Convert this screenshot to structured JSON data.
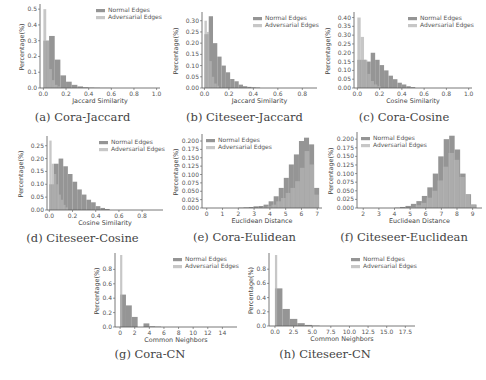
{
  "colors": {
    "normal": "#8f8f8f",
    "adversarial": "#b4b4b4",
    "axis": "#555555"
  },
  "legend": {
    "normal": "Normal Edges",
    "adversarial": "Adversarial Edges"
  },
  "chart_data": [
    {
      "id": "a",
      "type": "bar",
      "title": "",
      "caption": "(a) Cora-Jaccard",
      "xlabel": "Jaccard Similarity",
      "ylabel": "Percentage(%)",
      "xlim": [
        -0.03,
        1.03
      ],
      "ylim": [
        0,
        0.52
      ],
      "xticks": [
        0.0,
        0.2,
        0.4,
        0.6,
        0.8,
        1.0
      ],
      "xtick_labels": [
        "0.0",
        "0.2",
        "0.4",
        "0.6",
        "0.8",
        "1.0"
      ],
      "yticks": [
        0.0,
        0.1,
        0.2,
        0.3,
        0.4,
        0.5
      ],
      "ytick_labels": [
        "0.0",
        "0.1",
        "0.2",
        "0.3",
        "0.4",
        "0.5"
      ],
      "legend_position": "upper right",
      "series": [
        {
          "name": "Normal Edges",
          "bin_start": 0.0,
          "bin_width": 0.05,
          "values": [
            0.3,
            0.33,
            0.18,
            0.08,
            0.04,
            0.02,
            0.01,
            0.005,
            0.003,
            0.002,
            0.001,
            0.001
          ]
        },
        {
          "name": "Adversarial Edges",
          "bin_start": 0.0,
          "bin_width": 0.025,
          "values": [
            0.5,
            0.3,
            0.12,
            0.05,
            0.02,
            0.01
          ]
        }
      ]
    },
    {
      "id": "b",
      "type": "bar",
      "title": "",
      "caption": "(b) Citeseer-Jaccard",
      "xlabel": "Jaccard Similarity",
      "ylabel": "Percentage(%)",
      "xlim": [
        -0.02,
        0.92
      ],
      "ylim": [
        0,
        0.33
      ],
      "xticks": [
        0.0,
        0.2,
        0.4,
        0.6,
        0.8
      ],
      "xtick_labels": [
        "0.0",
        "0.2",
        "0.4",
        "0.6",
        "0.8"
      ],
      "yticks": [
        0.0,
        0.05,
        0.1,
        0.15,
        0.2,
        0.25,
        0.3
      ],
      "ytick_labels": [
        "0.00",
        "0.05",
        "0.10",
        "0.15",
        "0.20",
        "0.25",
        "0.30"
      ],
      "legend_position": "upper right",
      "series": [
        {
          "name": "Normal Edges",
          "bin_start": 0.0,
          "bin_width": 0.035,
          "values": [
            0.24,
            0.32,
            0.2,
            0.14,
            0.1,
            0.07,
            0.04,
            0.03,
            0.015,
            0.008,
            0.005,
            0.003,
            0.002
          ]
        },
        {
          "name": "Adversarial Edges",
          "bin_start": 0.0,
          "bin_width": 0.02,
          "values": [
            0.3,
            0.25,
            0.12,
            0.05,
            0.02,
            0.01
          ]
        }
      ]
    },
    {
      "id": "c",
      "type": "bar",
      "title": "",
      "caption": "(c) Cora-Cosine",
      "xlabel": "Cosine Similarity",
      "ylabel": "Percentage(%)",
      "xlim": [
        -0.03,
        1.03
      ],
      "ylim": [
        0,
        0.42
      ],
      "xticks": [
        0.0,
        0.2,
        0.4,
        0.6,
        0.8,
        1.0
      ],
      "xtick_labels": [
        "0.0",
        "0.2",
        "0.4",
        "0.6",
        "0.8",
        "1.0"
      ],
      "yticks": [
        0.0,
        0.05,
        0.1,
        0.15,
        0.2,
        0.25,
        0.3,
        0.35,
        0.4
      ],
      "ytick_labels": [
        "0.00",
        "0.05",
        "0.10",
        "0.15",
        "0.20",
        "0.25",
        "0.30",
        "0.35",
        "0.40"
      ],
      "legend_position": "upper right",
      "series": [
        {
          "name": "Normal Edges",
          "bin_start": 0.0,
          "bin_width": 0.04,
          "values": [
            0.16,
            0.16,
            0.15,
            0.2,
            0.16,
            0.13,
            0.1,
            0.07,
            0.05,
            0.03,
            0.02,
            0.01,
            0.005
          ]
        },
        {
          "name": "Adversarial Edges",
          "bin_start": 0.0,
          "bin_width": 0.03,
          "values": [
            0.4,
            0.29,
            0.16,
            0.08,
            0.04,
            0.02,
            0.01
          ]
        }
      ]
    },
    {
      "id": "d",
      "type": "bar",
      "title": "",
      "caption": "(d) Citeseer-Cosine",
      "xlabel": "Cosine Similarity",
      "ylabel": "Percentage(%)",
      "xlim": [
        -0.02,
        0.98
      ],
      "ylim": [
        0,
        0.28
      ],
      "xticks": [
        0.0,
        0.2,
        0.4,
        0.6,
        0.8
      ],
      "xtick_labels": [
        "0.0",
        "0.2",
        "0.4",
        "0.6",
        "0.8"
      ],
      "yticks": [
        0.0,
        0.05,
        0.1,
        0.15,
        0.2,
        0.25
      ],
      "ytick_labels": [
        "0.00",
        "0.05",
        "0.10",
        "0.15",
        "0.20",
        "0.25"
      ],
      "legend_position": "upper right",
      "series": [
        {
          "name": "Normal Edges",
          "bin_start": 0.0,
          "bin_width": 0.04,
          "values": [
            0.1,
            0.18,
            0.2,
            0.17,
            0.14,
            0.11,
            0.08,
            0.06,
            0.04,
            0.03,
            0.015,
            0.008,
            0.004
          ]
        },
        {
          "name": "Adversarial Edges",
          "bin_start": 0.0,
          "bin_width": 0.02,
          "values": [
            0.27,
            0.18,
            0.14,
            0.1,
            0.06,
            0.04,
            0.02,
            0.01
          ]
        }
      ]
    },
    {
      "id": "e",
      "type": "bar",
      "title": "",
      "caption": "(e) Cora-Eulidean",
      "xlabel": "Euclidean Distance",
      "ylabel": "Percentage(%)",
      "xlim": [
        -0.3,
        7.3
      ],
      "ylim": [
        0,
        0.215
      ],
      "xticks": [
        0,
        1,
        2,
        3,
        4,
        5,
        6,
        7
      ],
      "xtick_labels": [
        "0",
        "1",
        "2",
        "3",
        "4",
        "5",
        "6",
        "7"
      ],
      "yticks": [
        0.0,
        0.025,
        0.05,
        0.075,
        0.1,
        0.125,
        0.15,
        0.175,
        0.2
      ],
      "ytick_labels": [
        "0.000",
        "0.025",
        "0.050",
        "0.075",
        "0.100",
        "0.125",
        "0.150",
        "0.175",
        "0.200"
      ],
      "legend_position": "upper left",
      "series": [
        {
          "name": "Normal Edges",
          "bin_start": 2.0,
          "bin_width": 0.32,
          "values": [
            0.001,
            0.002,
            0.003,
            0.005,
            0.006,
            0.01,
            0.02,
            0.035,
            0.06,
            0.09,
            0.13,
            0.16,
            0.2,
            0.21,
            0.19,
            0.06
          ]
        },
        {
          "name": "Adversarial Edges",
          "bin_start": 3.5,
          "bin_width": 0.3,
          "values": [
            0.002,
            0.005,
            0.01,
            0.02,
            0.03,
            0.045,
            0.06,
            0.08,
            0.12,
            0.17,
            0.13,
            0.04
          ]
        }
      ]
    },
    {
      "id": "f",
      "type": "bar",
      "title": "",
      "caption": "(f) Citeseer-Euclidean",
      "xlabel": "Euclidean Distance",
      "ylabel": "Percentage(%)",
      "xlim": [
        1.6,
        9.6
      ],
      "ylim": [
        0,
        0.215
      ],
      "xticks": [
        2,
        3,
        4,
        5,
        6,
        7,
        8,
        9
      ],
      "xtick_labels": [
        "2",
        "3",
        "4",
        "5",
        "6",
        "7",
        "8",
        "9"
      ],
      "yticks": [
        0.0,
        0.025,
        0.05,
        0.075,
        0.1,
        0.125,
        0.15,
        0.175,
        0.2
      ],
      "ytick_labels": [
        "0.000",
        "0.025",
        "0.050",
        "0.075",
        "0.100",
        "0.125",
        "0.150",
        "0.175",
        "0.200"
      ],
      "legend_position": "upper left",
      "series": [
        {
          "name": "Normal Edges",
          "bin_start": 4.0,
          "bin_width": 0.35,
          "values": [
            0.001,
            0.003,
            0.006,
            0.012,
            0.02,
            0.035,
            0.06,
            0.1,
            0.15,
            0.2,
            0.21,
            0.17,
            0.1,
            0.04,
            0.01
          ]
        },
        {
          "name": "Adversarial Edges",
          "bin_start": 5.0,
          "bin_width": 0.35,
          "values": [
            0.003,
            0.008,
            0.015,
            0.03,
            0.05,
            0.08,
            0.12,
            0.16,
            0.14,
            0.09,
            0.04,
            0.01
          ]
        }
      ]
    },
    {
      "id": "g",
      "type": "bar",
      "title": "",
      "caption": "(g) Cora-CN",
      "xlabel": "Common Neighbors",
      "ylabel": "Percentage(%)",
      "xlim": [
        -0.7,
        16
      ],
      "ylim": [
        0,
        1.0
      ],
      "xticks": [
        0,
        2,
        4,
        6,
        8,
        10,
        12,
        14
      ],
      "xtick_labels": [
        "0",
        "2",
        "4",
        "6",
        "8",
        "10",
        "12",
        "14"
      ],
      "yticks": [
        0.0,
        0.2,
        0.4,
        0.6,
        0.8
      ],
      "ytick_labels": [
        "0.0",
        "0.2",
        "0.4",
        "0.6",
        "0.8"
      ],
      "legend_position": "upper right",
      "series": [
        {
          "name": "Normal Edges",
          "bin_start": 0.0,
          "bin_width": 0.8,
          "values": [
            0.45,
            0.3,
            0.14,
            0.0,
            0.05,
            0.01,
            0.005
          ]
        },
        {
          "name": "Adversarial Edges",
          "bin_start": 0.0,
          "bin_width": 0.3,
          "values": [
            1.0
          ]
        }
      ]
    },
    {
      "id": "h",
      "type": "bar",
      "title": "",
      "caption": "(h) Citeseer-CN",
      "xlabel": "Common Neighbors",
      "ylabel": "Percentage(%)",
      "xlim": [
        -0.8,
        18.8
      ],
      "ylim": [
        0,
        1.0
      ],
      "xticks": [
        0.0,
        2.5,
        5.0,
        7.5,
        10.0,
        12.5,
        15.0,
        17.5
      ],
      "xtick_labels": [
        "0.0",
        "2.5",
        "5.0",
        "7.5",
        "10.0",
        "12.5",
        "15.0",
        "17.5"
      ],
      "yticks": [
        0.0,
        0.2,
        0.4,
        0.6,
        0.8
      ],
      "ytick_labels": [
        "0.0",
        "0.2",
        "0.4",
        "0.6",
        "0.8"
      ],
      "legend_position": "upper right",
      "series": [
        {
          "name": "Normal Edges",
          "bin_start": 0.0,
          "bin_width": 1.0,
          "values": [
            0.53,
            0.24,
            0.1,
            0.04,
            0.015,
            0.005
          ]
        },
        {
          "name": "Adversarial Edges",
          "bin_start": 0.0,
          "bin_width": 0.3,
          "values": [
            1.0
          ]
        }
      ]
    }
  ]
}
